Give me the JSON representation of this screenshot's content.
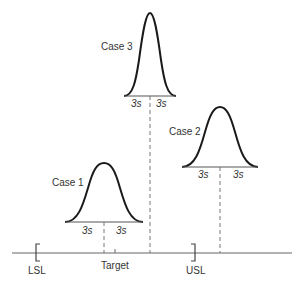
{
  "diagram": {
    "cases": [
      {
        "name": "Case 1",
        "left_label": "3s",
        "right_label": "3s"
      },
      {
        "name": "Case 2",
        "left_label": "3s",
        "right_label": "3s"
      },
      {
        "name": "Case 3",
        "left_label": "3s",
        "right_label": "3s"
      }
    ],
    "axis": {
      "lsl": "LSL",
      "target": "Target",
      "usl": "USL"
    }
  }
}
